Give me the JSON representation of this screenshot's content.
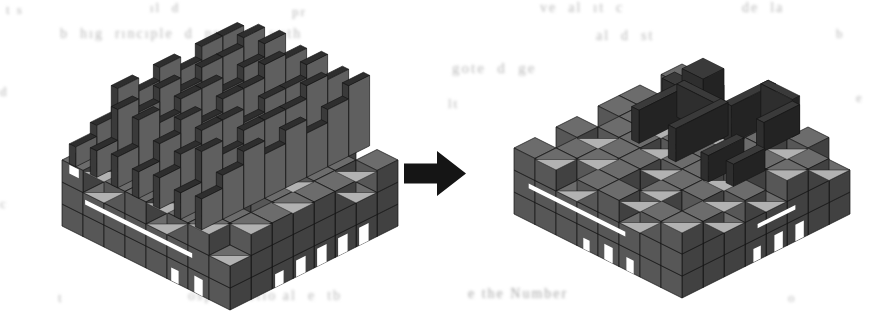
{
  "figure": {
    "kind": "voxel-structure-transformation",
    "background": "#ffffff"
  },
  "arrow": {
    "color": "#151515",
    "points": [
      [
        404,
        163.5
      ],
      [
        437,
        163.5
      ],
      [
        437,
        151
      ],
      [
        466,
        173.5
      ],
      [
        437,
        196
      ],
      [
        437,
        183.5
      ],
      [
        404,
        183.5
      ]
    ]
  },
  "projection": {
    "w": 21,
    "h": 10.5,
    "v": 22
  },
  "palette": {
    "edge": "#161616",
    "light": "#b2b2b2",
    "base": {
      "top": "#6c6c6c",
      "right": "#414141",
      "left": "#575757"
    },
    "fin": {
      "top": "#2e2e2e",
      "right": "#5f5f5f",
      "left": "#3a3a3a"
    },
    "decor": {
      "top": "#3a3a3a",
      "right": "#232323",
      "left": "#2e2e2e"
    },
    "slot": "#ffffff"
  },
  "left_scene": {
    "origin": {
      "x": 230,
      "y": 142
    },
    "grid": {
      "nx": 8,
      "ny": 8,
      "base_layers": 2
    },
    "top_pattern": [
      [
        1,
        0,
        1,
        0,
        1,
        1,
        0,
        1
      ],
      [
        0,
        1,
        1,
        1,
        0,
        1,
        1,
        0
      ],
      [
        1,
        1,
        0,
        1,
        1,
        0,
        1,
        1
      ],
      [
        1,
        0,
        1,
        0,
        1,
        1,
        0,
        1
      ],
      [
        0,
        1,
        1,
        1,
        0,
        1,
        1,
        1
      ],
      [
        1,
        1,
        0,
        1,
        1,
        1,
        0,
        1
      ],
      [
        0,
        1,
        1,
        0,
        1,
        0,
        1,
        1
      ],
      [
        1,
        0,
        1,
        1,
        0,
        1,
        1,
        0
      ]
    ],
    "fins": {
      "thickness": 0.3,
      "x_offset": 0.35,
      "profiles": [
        [
          2.6,
          2.6,
          2.0,
          2.6,
          2.0,
          2.6,
          1.4,
          0.9
        ],
        [
          3.0,
          2.6,
          2.6,
          2.0,
          2.6,
          2.0,
          2.6,
          1.2
        ],
        [
          3.2,
          2.6,
          2.0,
          2.6,
          2.6,
          2.0,
          2.6,
          1.4
        ],
        [
          3.0,
          3.2,
          2.6,
          2.6,
          2.0,
          2.6,
          2.0,
          1.2
        ],
        [
          3.2,
          2.6,
          2.6,
          2.0,
          2.6,
          2.6,
          2.0,
          1.4
        ],
        [
          3.0,
          3.2,
          2.6,
          2.6,
          2.6,
          2.0,
          2.6,
          1.2
        ],
        [
          3.2,
          2.6,
          2.0,
          2.6,
          2.0,
          2.6,
          2.0,
          1.4
        ]
      ]
    },
    "decor": [],
    "slots": [
      {
        "face": "left",
        "a0": 1.1,
        "a1": 6.2,
        "z0": 1.5,
        "z1": 1.72
      },
      {
        "face": "left",
        "a0": 0.35,
        "a1": 0.8,
        "z0": 2.55,
        "z1": 2.95
      },
      {
        "face": "right",
        "a0": 1.4,
        "a1": 1.85,
        "z0": 0,
        "z1": 0.8
      },
      {
        "face": "right",
        "a0": 2.4,
        "a1": 2.85,
        "z0": 0,
        "z1": 0.8
      },
      {
        "face": "right",
        "a0": 3.4,
        "a1": 3.85,
        "z0": 0,
        "z1": 0.8
      },
      {
        "face": "right",
        "a0": 4.4,
        "a1": 4.85,
        "z0": 0,
        "z1": 0.75
      },
      {
        "face": "right",
        "a0": 5.45,
        "a1": 5.85,
        "z0": 0,
        "z1": 0.6
      },
      {
        "face": "left",
        "a0": 6.3,
        "a1": 6.7,
        "z0": 0,
        "z1": 0.75
      },
      {
        "face": "left",
        "a0": 5.2,
        "a1": 5.55,
        "z0": 0,
        "z1": 0.6
      }
    ]
  },
  "right_scene": {
    "origin": {
      "x": 682,
      "y": 130
    },
    "grid": {
      "nx": 8,
      "ny": 8,
      "base_layers": 2
    },
    "top_pattern": [
      [
        1,
        1,
        0,
        1,
        1,
        0,
        1,
        0
      ],
      [
        0,
        1,
        1,
        0,
        1,
        1,
        0,
        1
      ],
      [
        1,
        0,
        1,
        1,
        0,
        1,
        1,
        1
      ],
      [
        1,
        1,
        0,
        1,
        1,
        0,
        1,
        0
      ],
      [
        0,
        1,
        1,
        0,
        1,
        1,
        0,
        1
      ],
      [
        1,
        0,
        1,
        1,
        0,
        1,
        1,
        0
      ],
      [
        0,
        1,
        1,
        1,
        0,
        1,
        0,
        1
      ],
      [
        1,
        1,
        0,
        1,
        1,
        0,
        1,
        1
      ]
    ],
    "fins": null,
    "decor": [
      {
        "x": 1.9,
        "y": 0.9,
        "sx": 1.0,
        "sy": 1.0,
        "h": 1.6
      },
      {
        "x": 1.15,
        "y": 1.5,
        "sx": 0.75,
        "sy": 0.6,
        "h": 0.9
      },
      {
        "x": 2.4,
        "y": 2.3,
        "sx": 0.35,
        "sy": 2.5,
        "h": 1.5
      },
      {
        "x": 2.4,
        "y": 2.3,
        "sx": 2.1,
        "sy": 0.35,
        "h": 1.5
      },
      {
        "x": 4.15,
        "y": 2.3,
        "sx": 0.35,
        "sy": 2.5,
        "h": 1.5
      },
      {
        "x": 4.6,
        "y": 0.5,
        "sx": 0.35,
        "sy": 2.1,
        "h": 1.7
      },
      {
        "x": 4.6,
        "y": 0.5,
        "sx": 1.5,
        "sy": 0.35,
        "h": 1.7
      },
      {
        "x": 5.75,
        "y": 0.5,
        "sx": 0.35,
        "sy": 1.7,
        "h": 1.3
      },
      {
        "x": 5.9,
        "y": 3.3,
        "sx": 0.35,
        "sy": 1.7,
        "h": 1.2
      },
      {
        "x": 6.7,
        "y": 3.1,
        "sx": 0.35,
        "sy": 1.5,
        "h": 1.0
      }
    ],
    "slots": [
      {
        "face": "left",
        "a0": 0.7,
        "a1": 5.3,
        "z0": 1.5,
        "z1": 1.72
      },
      {
        "face": "right",
        "a0": 2.6,
        "a1": 4.4,
        "z0": 1.45,
        "z1": 1.65
      },
      {
        "face": "right",
        "a0": 2.2,
        "a1": 2.6,
        "z0": 0,
        "z1": 0.75
      },
      {
        "face": "right",
        "a0": 3.2,
        "a1": 3.6,
        "z0": 0,
        "z1": 0.75
      },
      {
        "face": "right",
        "a0": 4.25,
        "a1": 4.6,
        "z0": 0,
        "z1": 0.6
      },
      {
        "face": "left",
        "a0": 4.3,
        "a1": 4.7,
        "z0": 0,
        "z1": 0.7
      },
      {
        "face": "left",
        "a0": 5.35,
        "a1": 5.7,
        "z0": 0,
        "z1": 0.6
      },
      {
        "face": "left",
        "a0": 3.3,
        "a1": 3.6,
        "z0": 0,
        "z1": 0.5
      }
    ]
  },
  "ghost_text": {
    "color": "#b8b8b8",
    "items": [
      {
        "x": 6,
        "y": 2,
        "s": 13,
        "t": "t s"
      },
      {
        "x": 150,
        "y": 0,
        "s": 13,
        "t": "ıl  d"
      },
      {
        "x": 292,
        "y": 4,
        "s": 13,
        "t": "pr"
      },
      {
        "x": 540,
        "y": 0,
        "s": 14,
        "t": "ve  al  ıt  c"
      },
      {
        "x": 742,
        "y": 0,
        "s": 14,
        "t": "de  la"
      },
      {
        "x": 60,
        "y": 26,
        "s": 14,
        "t": "b  hıg  rıncıple  d  prınted  wıth"
      },
      {
        "x": 596,
        "y": 28,
        "s": 14,
        "t": "al  d  st"
      },
      {
        "x": 836,
        "y": 26,
        "s": 13,
        "t": "b"
      },
      {
        "x": 0,
        "y": 84,
        "s": 13,
        "t": "d"
      },
      {
        "x": 452,
        "y": 60,
        "s": 15,
        "t": "gote  d  ge"
      },
      {
        "x": 448,
        "y": 96,
        "s": 13,
        "t": "lt"
      },
      {
        "x": 856,
        "y": 90,
        "s": 13,
        "t": "e"
      },
      {
        "x": 0,
        "y": 196,
        "s": 13,
        "t": "c"
      },
      {
        "x": 58,
        "y": 290,
        "s": 13,
        "t": "t"
      },
      {
        "x": 188,
        "y": 288,
        "s": 14,
        "t": "ospe  fnctıo al  e  tb"
      },
      {
        "x": 468,
        "y": 286,
        "s": 14,
        "t": "e the Number",
        "c": "#a6a6a6"
      },
      {
        "x": 788,
        "y": 290,
        "s": 13,
        "t": "o"
      }
    ]
  }
}
